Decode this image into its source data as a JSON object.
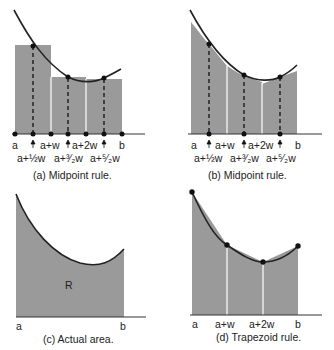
{
  "panels": [
    {
      "id": "a",
      "caption": "(a)  Midpoint rule.",
      "top_labels": [
        "a",
        "a+w",
        "a+2w",
        "b"
      ],
      "bottom_labels": [
        "a+½w",
        "a+³⁄₂w",
        "a+⁵⁄₂w"
      ]
    },
    {
      "id": "b",
      "caption": "(b)  Midpoint rule.",
      "top_labels": [
        "a",
        "a+w",
        "a+2w",
        "b"
      ],
      "bottom_labels": [
        "a+½w",
        "a+³⁄₂w",
        "a+⁵⁄₂w"
      ]
    },
    {
      "id": "c",
      "caption": "(c)  Actual area.",
      "region_label": "R",
      "axis_labels": [
        "a",
        "b"
      ]
    },
    {
      "id": "d",
      "caption": "(d)  Trapezoid rule.",
      "axis_labels": [
        "a",
        "a+w",
        "a+2w",
        "b"
      ]
    }
  ],
  "colors": {
    "fill": "#9a9a9a",
    "curve": "#222222",
    "background": "#ffffff"
  }
}
